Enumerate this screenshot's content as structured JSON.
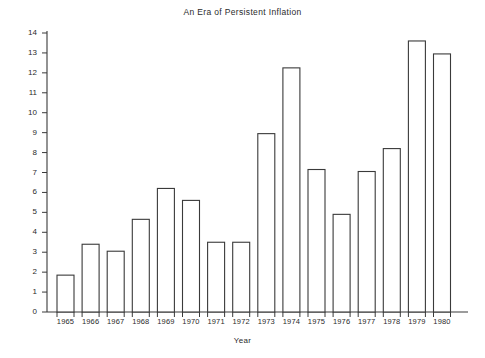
{
  "chart_data": {
    "type": "bar",
    "title": "An Era of Persistent Inflation",
    "xlabel": "Year",
    "ylabel": "Percent of Inflation",
    "categories": [
      "1965",
      "1966",
      "1967",
      "1968",
      "1969",
      "1970",
      "1971",
      "1972",
      "1973",
      "1974",
      "1975",
      "1976",
      "1977",
      "1978",
      "1979",
      "1980"
    ],
    "values": [
      1.85,
      3.4,
      3.05,
      4.65,
      6.2,
      5.6,
      3.5,
      3.5,
      8.95,
      12.25,
      7.15,
      4.9,
      7.05,
      8.2,
      13.6,
      12.95
    ],
    "ylim": [
      0,
      14
    ],
    "ytick_labels": [
      "0",
      "1",
      "2",
      "3",
      "4",
      "5",
      "6",
      "7",
      "8",
      "9",
      "10",
      "11",
      "12",
      "13",
      "14"
    ],
    "ytick_step": 1,
    "grid": false,
    "legend": null,
    "bar_style": {
      "fill": "#ffffff",
      "stroke": "#3a3a3a"
    },
    "background": "#ffffff"
  }
}
